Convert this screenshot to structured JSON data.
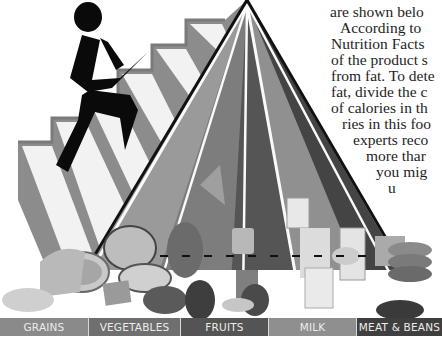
{
  "figure": {
    "package_labels": [
      "PEACHES",
      "RAISINS",
      "MILK"
    ]
  },
  "body_text": {
    "lines": [
      "are shown belo",
      "According to",
      "Nutrition Facts",
      "of the product s",
      "from fat. To dete",
      "fat, divide the c",
      "of calories in th",
      "ries in this foo",
      "experts reco",
      "more thar",
      "you mig",
      "u"
    ]
  },
  "food_groups": [
    {
      "label": "GRAINS",
      "color": "#8a8a8a",
      "width": 89
    },
    {
      "label": "VEGETABLES",
      "color": "#6f6f6f",
      "width": 92
    },
    {
      "label": "FRUITS",
      "color": "#545454",
      "width": 88
    },
    {
      "label": "MILK",
      "color": "#8f8f8f",
      "width": 88
    },
    {
      "label": "MEAT & BEANS",
      "color": "#3f3f3f",
      "width": 85
    }
  ],
  "colors": {
    "stair_gray": "#8c8c8c",
    "stair_white": "#f4f4f4",
    "pyramid_outline": "#111111",
    "figure": "#0a0a0a"
  }
}
